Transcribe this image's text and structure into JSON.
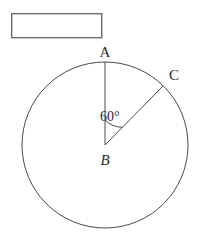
{
  "figure": {
    "kind": "circle-with-central-angle",
    "background_color": "#ffffff",
    "stroke_color": "#4a4a4a",
    "text_color": "#2b2b2b",
    "answer_box": {
      "label": "",
      "border_color": "#6b6b6b",
      "fill_color": "#ffffff",
      "x": 11,
      "y": 13,
      "width": 91,
      "height": 25
    },
    "circle": {
      "center_x": 105,
      "center_y": 145,
      "radius": 83
    },
    "labels": {
      "point_a": "A",
      "point_b": "B",
      "point_c": "C",
      "angle": "60°"
    },
    "points": {
      "a": {
        "x": 105,
        "y": 62
      },
      "b": {
        "x": 105,
        "y": 145
      },
      "c": {
        "x": 163,
        "y": 86
      }
    },
    "label_positions": {
      "a": {
        "x": 105,
        "y": 57
      },
      "b": {
        "x": 105,
        "y": 163
      },
      "c": {
        "x": 172,
        "y": 79
      },
      "angle": {
        "x": 103,
        "y": 120
      }
    }
  }
}
